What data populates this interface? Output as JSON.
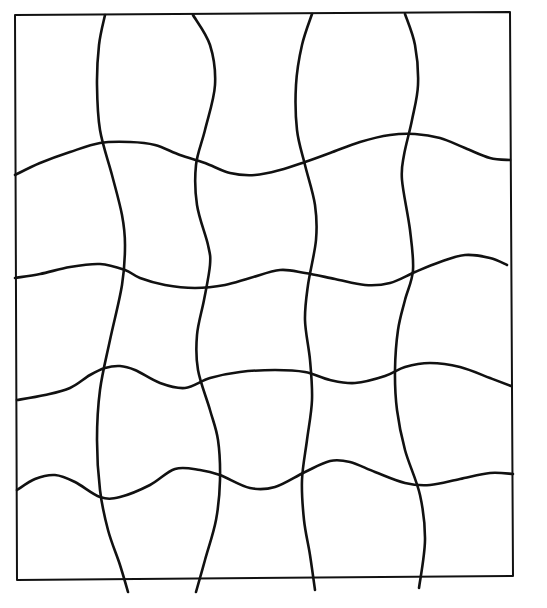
{
  "colors": {
    "background": "#ffffff",
    "line": "#111111"
  },
  "border": {
    "corners": [
      [
        15,
        15
      ],
      [
        510,
        12
      ],
      [
        513,
        576
      ],
      [
        17,
        580
      ]
    ]
  },
  "vertical_lines": [
    {
      "id": "v1",
      "points": [
        [
          105,
          15
        ],
        [
          99,
          45
        ],
        [
          97,
          85
        ],
        [
          100,
          130
        ],
        [
          112,
          175
        ],
        [
          122,
          215
        ],
        [
          125,
          245
        ],
        [
          122,
          285
        ],
        [
          110,
          340
        ],
        [
          100,
          390
        ],
        [
          97,
          440
        ],
        [
          100,
          490
        ],
        [
          108,
          530
        ],
        [
          120,
          565
        ],
        [
          128,
          592
        ]
      ]
    },
    {
      "id": "v2",
      "points": [
        [
          193,
          15
        ],
        [
          210,
          45
        ],
        [
          215,
          85
        ],
        [
          205,
          130
        ],
        [
          196,
          165
        ],
        [
          197,
          205
        ],
        [
          208,
          245
        ],
        [
          210,
          265
        ],
        [
          204,
          300
        ],
        [
          197,
          335
        ],
        [
          198,
          370
        ],
        [
          210,
          410
        ],
        [
          218,
          440
        ],
        [
          220,
          480
        ],
        [
          216,
          520
        ],
        [
          205,
          560
        ],
        [
          196,
          592
        ]
      ]
    },
    {
      "id": "v3",
      "points": [
        [
          312,
          14
        ],
        [
          302,
          45
        ],
        [
          296,
          85
        ],
        [
          297,
          130
        ],
        [
          305,
          165
        ],
        [
          315,
          205
        ],
        [
          316,
          240
        ],
        [
          308,
          285
        ],
        [
          305,
          320
        ],
        [
          310,
          360
        ],
        [
          312,
          400
        ],
        [
          307,
          440
        ],
        [
          302,
          480
        ],
        [
          304,
          520
        ],
        [
          310,
          555
        ],
        [
          315,
          590
        ]
      ]
    },
    {
      "id": "v4",
      "points": [
        [
          405,
          14
        ],
        [
          415,
          45
        ],
        [
          418,
          85
        ],
        [
          412,
          120
        ],
        [
          404,
          155
        ],
        [
          402,
          180
        ],
        [
          410,
          230
        ],
        [
          413,
          270
        ],
        [
          405,
          300
        ],
        [
          398,
          330
        ],
        [
          395,
          370
        ],
        [
          397,
          410
        ],
        [
          405,
          450
        ],
        [
          420,
          495
        ],
        [
          425,
          540
        ],
        [
          419,
          588
        ]
      ]
    }
  ],
  "horizontal_lines": [
    {
      "id": "h1",
      "points": [
        [
          15,
          175
        ],
        [
          40,
          163
        ],
        [
          70,
          152
        ],
        [
          100,
          143
        ],
        [
          130,
          142
        ],
        [
          155,
          145
        ],
        [
          180,
          155
        ],
        [
          205,
          163
        ],
        [
          230,
          173
        ],
        [
          255,
          175
        ],
        [
          280,
          170
        ],
        [
          305,
          162
        ],
        [
          330,
          153
        ],
        [
          360,
          142
        ],
        [
          390,
          135
        ],
        [
          415,
          134
        ],
        [
          440,
          138
        ],
        [
          465,
          148
        ],
        [
          490,
          158
        ],
        [
          510,
          160
        ]
      ]
    },
    {
      "id": "h2",
      "points": [
        [
          15,
          278
        ],
        [
          40,
          274
        ],
        [
          70,
          267
        ],
        [
          100,
          264
        ],
        [
          125,
          270
        ],
        [
          140,
          278
        ],
        [
          165,
          285
        ],
        [
          195,
          288
        ],
        [
          225,
          285
        ],
        [
          250,
          278
        ],
        [
          280,
          270
        ],
        [
          305,
          273
        ],
        [
          335,
          279
        ],
        [
          365,
          285
        ],
        [
          390,
          283
        ],
        [
          415,
          272
        ],
        [
          440,
          262
        ],
        [
          465,
          255
        ],
        [
          490,
          258
        ],
        [
          507,
          265
        ]
      ]
    },
    {
      "id": "h3",
      "points": [
        [
          17,
          400
        ],
        [
          45,
          395
        ],
        [
          70,
          388
        ],
        [
          90,
          375
        ],
        [
          105,
          368
        ],
        [
          120,
          366
        ],
        [
          135,
          370
        ],
        [
          160,
          383
        ],
        [
          185,
          388
        ],
        [
          210,
          378
        ],
        [
          240,
          372
        ],
        [
          275,
          370
        ],
        [
          305,
          372
        ],
        [
          330,
          380
        ],
        [
          355,
          383
        ],
        [
          385,
          376
        ],
        [
          405,
          367
        ],
        [
          430,
          363
        ],
        [
          460,
          367
        ],
        [
          490,
          378
        ],
        [
          511,
          386
        ]
      ]
    },
    {
      "id": "h4",
      "points": [
        [
          17,
          490
        ],
        [
          35,
          479
        ],
        [
          55,
          475
        ],
        [
          75,
          482
        ],
        [
          100,
          497
        ],
        [
          120,
          497
        ],
        [
          150,
          485
        ],
        [
          175,
          469
        ],
        [
          200,
          470
        ],
        [
          220,
          475
        ],
        [
          250,
          488
        ],
        [
          275,
          487
        ],
        [
          305,
          472
        ],
        [
          330,
          461
        ],
        [
          350,
          462
        ],
        [
          375,
          472
        ],
        [
          405,
          483
        ],
        [
          430,
          485
        ],
        [
          460,
          479
        ],
        [
          490,
          473
        ],
        [
          513,
          474
        ]
      ]
    }
  ]
}
